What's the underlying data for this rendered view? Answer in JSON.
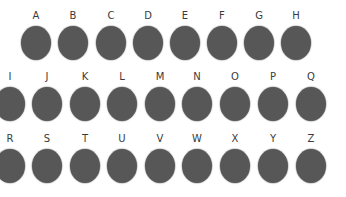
{
  "circle_color": "#575757",
  "label_color": "#3a3a3a",
  "rows": [
    {
      "top": 10,
      "items": [
        {
          "letter": "A",
          "x": 36
        },
        {
          "letter": "B",
          "x": 73
        },
        {
          "letter": "C",
          "x": 111
        },
        {
          "letter": "D",
          "x": 148
        },
        {
          "letter": "E",
          "x": 185
        },
        {
          "letter": "F",
          "x": 222
        },
        {
          "letter": "G",
          "x": 259
        },
        {
          "letter": "H",
          "x": 296
        }
      ]
    },
    {
      "top": 71,
      "items": [
        {
          "letter": "I",
          "x": 10
        },
        {
          "letter": "J",
          "x": 47
        },
        {
          "letter": "K",
          "x": 85
        },
        {
          "letter": "L",
          "x": 122
        },
        {
          "letter": "M",
          "x": 160
        },
        {
          "letter": "N",
          "x": 197
        },
        {
          "letter": "O",
          "x": 235
        },
        {
          "letter": "P",
          "x": 273
        },
        {
          "letter": "Q",
          "x": 311
        }
      ]
    },
    {
      "top": 133,
      "items": [
        {
          "letter": "R",
          "x": 10
        },
        {
          "letter": "S",
          "x": 47
        },
        {
          "letter": "T",
          "x": 85
        },
        {
          "letter": "U",
          "x": 122
        },
        {
          "letter": "V",
          "x": 160
        },
        {
          "letter": "W",
          "x": 197
        },
        {
          "letter": "X",
          "x": 235
        },
        {
          "letter": "Y",
          "x": 273
        },
        {
          "letter": "Z",
          "x": 311
        }
      ]
    }
  ]
}
